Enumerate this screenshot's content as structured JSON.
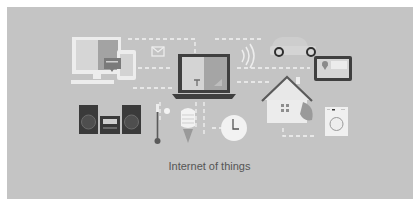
{
  "caption": "Internet of things",
  "colors": {
    "border": "#ffffff",
    "background": "#c4c4c4",
    "device_light": "#ededed",
    "device_dark": "#4a4a4a",
    "device_mid": "#9a9a9a",
    "connector": "#f2f2f2",
    "caption_text": "#555555"
  },
  "devices": [
    {
      "name": "desktop-computer"
    },
    {
      "name": "smartphone"
    },
    {
      "name": "envelope-mail"
    },
    {
      "name": "laptop"
    },
    {
      "name": "wifi-signal"
    },
    {
      "name": "car"
    },
    {
      "name": "tablet-map"
    },
    {
      "name": "stereo-speakers"
    },
    {
      "name": "thermometer"
    },
    {
      "name": "light-bulb"
    },
    {
      "name": "wall-clock"
    },
    {
      "name": "smart-house"
    },
    {
      "name": "washing-machine"
    }
  ]
}
